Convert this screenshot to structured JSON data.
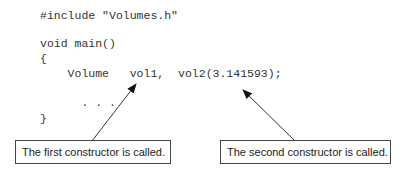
{
  "code": {
    "lines": [
      "#include \"Volumes.h\"",
      "void main()",
      "{",
      "    Volume   vol1,  vol2(3.141593);",
      "      . . .",
      "}"
    ]
  },
  "callouts": [
    {
      "text": "The first constructor is called."
    },
    {
      "text": "The second constructor is called."
    }
  ]
}
